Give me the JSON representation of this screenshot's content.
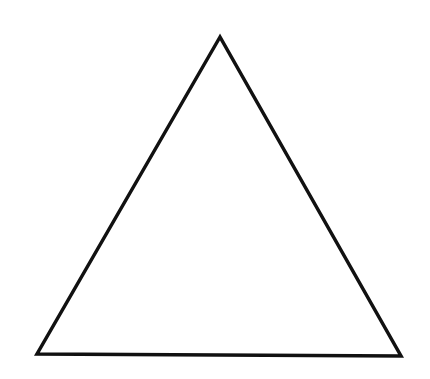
{
  "diagram": {
    "shape": "triangle",
    "type": "equilateral-outline",
    "stroke_color": "#111111",
    "fill_color": "#ffffff",
    "stroke_width": 3.5,
    "vertices": {
      "apex": [
        220,
        37
      ],
      "bottom_left": [
        37,
        354
      ],
      "bottom_right": [
        401,
        356
      ]
    }
  }
}
